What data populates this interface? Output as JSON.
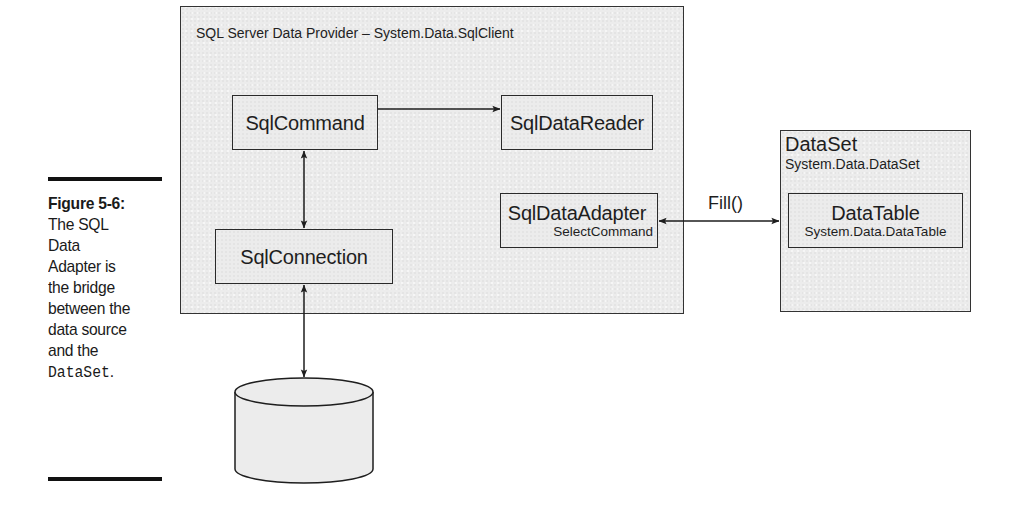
{
  "caption": {
    "figure_label": "Figure 5-6:",
    "lines": [
      "The SQL",
      "Data",
      "Adapter is",
      "the bridge",
      "between the",
      "data source",
      "and the"
    ],
    "code_term": "DataSet",
    "trailing_punct": "."
  },
  "provider": {
    "title": "SQL Server Data Provider – System.Data.SqlClient",
    "nodes": {
      "command": {
        "label": "SqlCommand"
      },
      "data_reader": {
        "label": "SqlDataReader"
      },
      "data_adapter": {
        "label": "SqlDataAdapter",
        "sublabel": "SelectCommand"
      },
      "connection": {
        "label": "SqlConnection"
      }
    }
  },
  "dataset": {
    "title": "DataSet",
    "subtitle": "System.Data.DataSet",
    "table": {
      "label": "DataTable",
      "sublabel": "System.Data.DataTable"
    }
  },
  "connector_labels": {
    "fill": "Fill()"
  },
  "database": {
    "line1": "AdventureWorks",
    "line2": "SQL Server 2005"
  },
  "colors": {
    "box_fill": "#ececec",
    "stroke": "#2a2a2a",
    "rule": "#111111"
  }
}
